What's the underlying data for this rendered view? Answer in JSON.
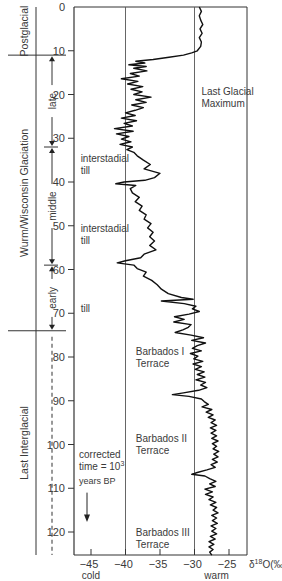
{
  "chart_data": {
    "type": "line",
    "xlabel": "δ18O(‰)",
    "ylabel": "corrected time = 10^3 years BP",
    "x_ticks": [
      -45,
      -40,
      -35,
      -30,
      -25
    ],
    "x_tick_labels": [
      "−45",
      "−40",
      "−35",
      "−30",
      "−25"
    ],
    "y_ticks": [
      0,
      10,
      20,
      30,
      40,
      50,
      60,
      70,
      80,
      90,
      100,
      110,
      120
    ],
    "xlim": [
      -47.5,
      -23.5
    ],
    "ylim": [
      0,
      125.3
    ],
    "grid": false,
    "reference_lines_x": [
      -40,
      -30
    ],
    "x_end_labels": {
      "cold": "cold",
      "warm": "warm"
    },
    "axis_unit_label": "δ18O(‰)",
    "series": [
      {
        "name": "δ18O",
        "points": [
          [
            0,
            -29.3
          ],
          [
            1,
            -29.0
          ],
          [
            2,
            -29.3
          ],
          [
            3,
            -29.1
          ],
          [
            4,
            -28.8
          ],
          [
            5,
            -29.2
          ],
          [
            6,
            -28.9
          ],
          [
            7,
            -29.3
          ],
          [
            8,
            -29.0
          ],
          [
            9,
            -29.1
          ],
          [
            10,
            -29.6
          ],
          [
            10.5,
            -30.4
          ],
          [
            11,
            -31.6
          ],
          [
            11.5,
            -33.7
          ],
          [
            12,
            -36.0
          ],
          [
            12.4,
            -38.5
          ],
          [
            12.8,
            -37.2
          ],
          [
            13.2,
            -39.5
          ],
          [
            13.6,
            -37.0
          ],
          [
            14,
            -38.8
          ],
          [
            14.6,
            -36.9
          ],
          [
            15.2,
            -39.3
          ],
          [
            15.8,
            -38.0
          ],
          [
            16.4,
            -40.6
          ],
          [
            17,
            -38.2
          ],
          [
            17.6,
            -39.7
          ],
          [
            18.2,
            -37.5
          ],
          [
            18.8,
            -39.2
          ],
          [
            19.4,
            -37.6
          ],
          [
            20,
            -38.8
          ],
          [
            20.6,
            -36.3
          ],
          [
            21.2,
            -38.5
          ],
          [
            21.8,
            -37.0
          ],
          [
            22.4,
            -39.1
          ],
          [
            23,
            -37.4
          ],
          [
            23.6,
            -38.6
          ],
          [
            24.2,
            -40.0
          ],
          [
            24.8,
            -38.6
          ],
          [
            25.4,
            -40.6
          ],
          [
            26,
            -38.4
          ],
          [
            26.6,
            -40.2
          ],
          [
            27.2,
            -39.0
          ],
          [
            27.8,
            -41.6
          ],
          [
            28.4,
            -38.9
          ],
          [
            29,
            -41.3
          ],
          [
            29.6,
            -39.5
          ],
          [
            30.2,
            -40.6
          ],
          [
            30.8,
            -39.2
          ],
          [
            31.4,
            -40.8
          ],
          [
            32,
            -39.0
          ],
          [
            32.6,
            -39.8
          ],
          [
            33.2,
            -38.8
          ],
          [
            34,
            -38.3
          ],
          [
            35,
            -37.4
          ],
          [
            36,
            -36.4
          ],
          [
            37,
            -37.3
          ],
          [
            38,
            -35.0
          ],
          [
            39,
            -35.8
          ],
          [
            39.6,
            -37.2
          ],
          [
            40,
            -40.2
          ],
          [
            40.4,
            -41.4
          ],
          [
            40.8,
            -38.5
          ],
          [
            41.5,
            -39.3
          ],
          [
            42.5,
            -39.0
          ],
          [
            43.5,
            -38.0
          ],
          [
            44.5,
            -38.6
          ],
          [
            45.5,
            -37.6
          ],
          [
            46.5,
            -38.0
          ],
          [
            47.5,
            -37.0
          ],
          [
            48.5,
            -37.3
          ],
          [
            49.5,
            -36.3
          ],
          [
            50.5,
            -36.8
          ],
          [
            51.5,
            -36.0
          ],
          [
            52.5,
            -36.5
          ],
          [
            53.5,
            -35.8
          ],
          [
            54.5,
            -36.5
          ],
          [
            55.5,
            -35.6
          ],
          [
            56.5,
            -37.3
          ],
          [
            57.3,
            -37.8
          ],
          [
            58,
            -40.0
          ],
          [
            58.5,
            -41.2
          ],
          [
            59,
            -38.8
          ],
          [
            59.8,
            -38.3
          ],
          [
            60.6,
            -37.0
          ],
          [
            61.5,
            -37.4
          ],
          [
            62.5,
            -36.2
          ],
          [
            63.5,
            -35.4
          ],
          [
            64.5,
            -34.8
          ],
          [
            65.5,
            -33.8
          ],
          [
            66.4,
            -31.9
          ],
          [
            66.8,
            -30.2
          ],
          [
            67.2,
            -34.8
          ],
          [
            67.8,
            -31.5
          ],
          [
            68.4,
            -29.8
          ],
          [
            69,
            -30.3
          ],
          [
            69.6,
            -29.3
          ],
          [
            70.2,
            -30.8
          ],
          [
            70.8,
            -32.9
          ],
          [
            71.4,
            -31.5
          ],
          [
            72,
            -33.0
          ],
          [
            72.6,
            -30.5
          ],
          [
            73.2,
            -30.9
          ],
          [
            73.8,
            -31.7
          ],
          [
            74.4,
            -32.8
          ],
          [
            75,
            -30.5
          ],
          [
            75.6,
            -28.7
          ],
          [
            76.2,
            -30.4
          ],
          [
            76.8,
            -28.4
          ],
          [
            77.4,
            -29.6
          ],
          [
            78,
            -30.3
          ],
          [
            78.6,
            -29.0
          ],
          [
            79.2,
            -30.6
          ],
          [
            79.8,
            -29.5
          ],
          [
            80.4,
            -30.1
          ],
          [
            81,
            -28.8
          ],
          [
            81.6,
            -30.2
          ],
          [
            82.2,
            -29.0
          ],
          [
            82.8,
            -29.9
          ],
          [
            83.4,
            -28.6
          ],
          [
            84,
            -29.6
          ],
          [
            84.6,
            -28.5
          ],
          [
            85.2,
            -29.8
          ],
          [
            85.8,
            -28.4
          ],
          [
            86.4,
            -29.1
          ],
          [
            87,
            -28.2
          ],
          [
            87.6,
            -29.4
          ],
          [
            88.2,
            -31.6
          ],
          [
            88.6,
            -33.2
          ],
          [
            89,
            -30.8
          ],
          [
            89.6,
            -29.0
          ],
          [
            90.2,
            -28.6
          ],
          [
            90.8,
            -28.0
          ],
          [
            91.4,
            -28.9
          ],
          [
            92,
            -27.5
          ],
          [
            92.6,
            -28.3
          ],
          [
            93.2,
            -27.3
          ],
          [
            93.8,
            -28.0
          ],
          [
            94.4,
            -27.0
          ],
          [
            95,
            -27.6
          ],
          [
            95.6,
            -26.8
          ],
          [
            96.2,
            -27.7
          ],
          [
            96.8,
            -26.9
          ],
          [
            97.4,
            -27.6
          ],
          [
            98,
            -26.8
          ],
          [
            98.6,
            -27.5
          ],
          [
            99.2,
            -26.6
          ],
          [
            99.8,
            -27.4
          ],
          [
            100.4,
            -26.8
          ],
          [
            101,
            -27.3
          ],
          [
            101.6,
            -26.5
          ],
          [
            102.2,
            -27.2
          ],
          [
            102.8,
            -26.6
          ],
          [
            103.4,
            -27.4
          ],
          [
            104,
            -26.7
          ],
          [
            104.6,
            -27.6
          ],
          [
            105.2,
            -27.0
          ],
          [
            105.8,
            -28.2
          ],
          [
            106.4,
            -29.6
          ],
          [
            106.8,
            -30.4
          ],
          [
            107.2,
            -28.5
          ],
          [
            107.8,
            -27.8
          ],
          [
            108.4,
            -26.9
          ],
          [
            109,
            -27.8
          ],
          [
            109.6,
            -27.0
          ],
          [
            110.2,
            -28.5
          ],
          [
            110.8,
            -27.4
          ],
          [
            111.4,
            -28.4
          ],
          [
            112,
            -27.3
          ],
          [
            112.6,
            -27.9
          ],
          [
            113.2,
            -26.9
          ],
          [
            113.8,
            -27.7
          ],
          [
            114.4,
            -26.8
          ],
          [
            115,
            -27.3
          ],
          [
            115.6,
            -26.6
          ],
          [
            116.2,
            -27.5
          ],
          [
            116.8,
            -26.8
          ],
          [
            117.4,
            -27.4
          ],
          [
            118,
            -26.7
          ],
          [
            118.6,
            -27.6
          ],
          [
            119.2,
            -26.9
          ],
          [
            119.8,
            -27.5
          ],
          [
            120.4,
            -26.8
          ],
          [
            121,
            -27.7
          ],
          [
            121.6,
            -27.0
          ],
          [
            122.2,
            -27.9
          ],
          [
            122.8,
            -27.2
          ],
          [
            123.4,
            -27.9
          ],
          [
            124,
            -27.3
          ],
          [
            124.6,
            -27.8
          ],
          [
            125.3,
            -27.5
          ]
        ]
      }
    ],
    "annotations": [
      {
        "text_lines": [
          "Last Glacial",
          "Maximum"
        ],
        "x": -29,
        "y": 20
      },
      {
        "text_lines": [
          "interstadial",
          "till"
        ],
        "x": -46.5,
        "y": 35.5
      },
      {
        "text_lines": [
          "interstadial",
          "till"
        ],
        "x": -46.5,
        "y": 51.5
      },
      {
        "text_lines": [
          "till"
        ],
        "x": -46.5,
        "y": 69.6
      },
      {
        "text_lines": [
          "Barbados I",
          "Terrace"
        ],
        "x": -38.5,
        "y": 79.5
      },
      {
        "text_lines": [
          "Barbados II",
          "Terrace"
        ],
        "x": -38.5,
        "y": 99.5
      },
      {
        "text_lines": [
          "Barbados III",
          "Terrace"
        ],
        "x": -38.5,
        "y": 121
      }
    ],
    "time_note": {
      "lines": [
        "corrected",
        "time = 10",
        "years BP"
      ],
      "superscript": "3"
    },
    "stages": {
      "outer": [
        {
          "label": "Postglacial",
          "from": 0,
          "to": 11
        },
        {
          "label": "Wurm/Wisconsin Glaciation",
          "from": 11,
          "to": 74
        },
        {
          "label": "Last Interglacial",
          "from": 74,
          "to": 125.3
        }
      ],
      "boundaries": [
        11,
        74
      ],
      "substages": [
        {
          "label": "late",
          "from": 11,
          "to": 32
        },
        {
          "label": "middle",
          "from": 32,
          "to": 59
        },
        {
          "label": "early",
          "from": 59,
          "to": 74
        }
      ]
    }
  }
}
